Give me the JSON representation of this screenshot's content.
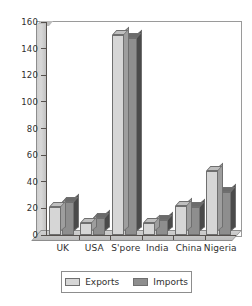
{
  "chart_data": {
    "type": "bar",
    "title": "",
    "subtitle": "",
    "xlabel": "",
    "ylabel": "",
    "categories": [
      "UK",
      "USA",
      "S'pore",
      "India",
      "China",
      "Nigeria"
    ],
    "series": [
      {
        "name": "Exports",
        "color": "#d6d6d6",
        "values": [
          21,
          9,
          150,
          9,
          22,
          48
        ]
      },
      {
        "name": "Imports",
        "color": "#8e8e8e",
        "values": [
          25,
          13,
          148,
          11,
          21,
          32
        ]
      }
    ],
    "ylim": [
      0,
      160
    ],
    "yticks": [
      0,
      20,
      40,
      60,
      80,
      100,
      120,
      140,
      160
    ],
    "ytick_labels": [
      "0",
      "20",
      "40",
      "60",
      "80",
      "100",
      "120",
      "140",
      "160"
    ],
    "grid": false,
    "legend_position": "bottom",
    "style": "3d-bar"
  },
  "legend": {
    "items": [
      {
        "label": "Exports",
        "swatch": "exports"
      },
      {
        "label": "Imports",
        "swatch": "imports"
      }
    ]
  }
}
